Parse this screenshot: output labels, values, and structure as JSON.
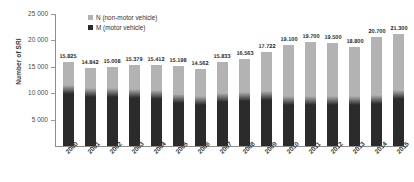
{
  "chart_data": {
    "type": "bar",
    "stacked": true,
    "title": "",
    "xlabel": "",
    "ylabel": "Number of SRI",
    "ylim": [
      0,
      25000
    ],
    "yticks": [
      "5 000",
      "10 000",
      "15 000",
      "20 000",
      "25 000"
    ],
    "ytick_values": [
      5000,
      10000,
      15000,
      20000,
      25000
    ],
    "grid": false,
    "legend_position": "top-left-inside",
    "categories": [
      "2000",
      "2001",
      "2002",
      "2003",
      "2004",
      "2005",
      "2006",
      "2007",
      "2008",
      "2009",
      "2010",
      "2011",
      "2012",
      "2013",
      "2014",
      "2015"
    ],
    "series": [
      {
        "name": "M (motor vehicle)",
        "color": "#2b2b2b",
        "values": [
          10650,
          10150,
          10100,
          9950,
          9750,
          8950,
          8600,
          9250,
          9450,
          9550,
          8700,
          8700,
          8700,
          8700,
          8800,
          9850
        ]
      },
      {
        "name": "N (non-motor vehicle)",
        "color": "#b3b3b3",
        "values": [
          5175,
          4692,
          4908,
          5429,
          5662,
          6248,
          5962,
          6583,
          7113,
          8172,
          10400,
          11000,
          10800,
          10100,
          11900,
          11450
        ]
      }
    ],
    "totals": [
      15825,
      14842,
      15008,
      15379,
      15412,
      15198,
      14562,
      15833,
      16563,
      17722,
      19100,
      19700,
      19500,
      18800,
      20700,
      21300
    ],
    "total_labels": [
      "15.825",
      "14.842",
      "15.008",
      "15.379",
      "15.412",
      "15.198",
      "14.562",
      "15.833",
      "16.563",
      "17.722",
      "19.100",
      "19.700",
      "19.500",
      "18.800",
      "20.700",
      "21.300"
    ],
    "legend": [
      {
        "label": "N (non-motor vehicle)",
        "swatch": "#b3b3b3"
      },
      {
        "label": "M (motor vehicle)",
        "swatch": "#2b2b2b"
      }
    ]
  }
}
